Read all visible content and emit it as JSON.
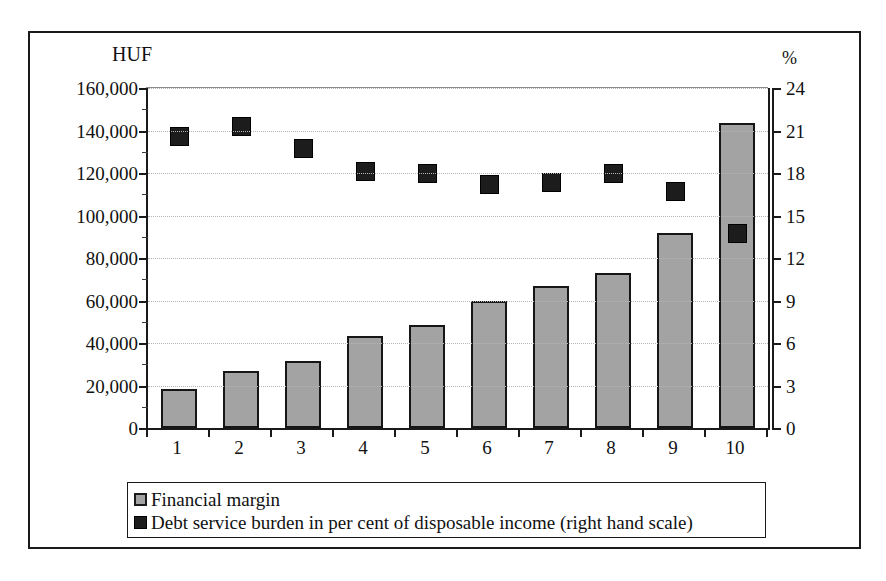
{
  "chart_data": {
    "type": "bar",
    "title": "",
    "subtitle": "",
    "categories": [
      "1",
      "2",
      "3",
      "4",
      "5",
      "6",
      "7",
      "8",
      "9",
      "10"
    ],
    "xlabel": "",
    "ylabel": "HUF",
    "y2label": "%",
    "ylim": [
      0,
      160000
    ],
    "y2lim": [
      0,
      24
    ],
    "ytick_labels": [
      "160,000",
      "140,000",
      "120,000",
      "100,000",
      "80,000",
      "60,000",
      "40,000",
      "20,000",
      "0"
    ],
    "ytick_values": [
      160000,
      140000,
      120000,
      100000,
      80000,
      60000,
      40000,
      20000,
      0
    ],
    "y2tick_labels": [
      "24",
      "21",
      "18",
      "15",
      "12",
      "9",
      "6",
      "3",
      "0"
    ],
    "y2tick_values": [
      24,
      21,
      18,
      15,
      12,
      9,
      6,
      3,
      0
    ],
    "grid": true,
    "legend_position": "bottom",
    "series": [
      {
        "name": "Financial margin",
        "type": "bar",
        "axis": "left",
        "unit": "HUF",
        "color": "#a3a3a3",
        "edge_color": "#161616",
        "values": [
          18500,
          27000,
          31500,
          43500,
          48500,
          60000,
          67000,
          73000,
          92000,
          143500
        ]
      },
      {
        "name": "Debt service burden in per cent of disposable income (right hand scale)",
        "type": "scatter",
        "axis": "right",
        "unit": "%",
        "color": "#1c1c1c",
        "edge_color": "#000000",
        "values": [
          20.6,
          21.3,
          19.7,
          18.1,
          18.0,
          17.2,
          17.3,
          18.0,
          16.7,
          13.7
        ]
      }
    ]
  },
  "axes": {
    "left_unit": "HUF",
    "right_unit": "%"
  },
  "legend": {
    "items": [
      {
        "label": "Financial margin",
        "swatch": "gray-square-icon"
      },
      {
        "label": "Debt service burden in per cent of disposable income (right hand scale)",
        "swatch": "black-square-icon"
      }
    ]
  }
}
